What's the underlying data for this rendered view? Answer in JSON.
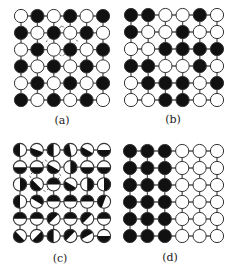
{
  "figure": {
    "panels": [
      {
        "id": "a",
        "label": "(a)",
        "description": "checkerboard spin arrangement",
        "type": "binary",
        "origin": [
          21,
          16
        ],
        "spacing": [
          16.4,
          16.8
        ],
        "label_pos": [
          62,
          120
        ],
        "grid": [
          "WBWBWB",
          "BWBWBW",
          "WBWBWB",
          "BWBWBW",
          "WBWBWB",
          "BWBWBW"
        ],
        "dashed_square": {
          "rows": [
            1,
            2
          ],
          "cols": [
            2,
            3
          ]
        }
      },
      {
        "id": "b",
        "label": "(b)",
        "description": "random binary arrangement",
        "type": "binary",
        "origin": [
          131,
          15
        ],
        "spacing": [
          17.2,
          17.0
        ],
        "label_pos": [
          173,
          119
        ],
        "grid": [
          "BBWWBW",
          "BWWBWW",
          "WWBBBB",
          "BBWWBW",
          "WBBBWB",
          "WWBBWW"
        ]
      },
      {
        "id": "c",
        "label": "(c)",
        "description": "half-filled circles with varied orientation (angle = direction black half points, degrees; 0=right, 90=down, 180=left, 270=up)",
        "type": "half",
        "origin": [
          20,
          150
        ],
        "spacing": [
          16.8,
          17.2
        ],
        "label_pos": [
          60,
          258
        ],
        "angles": [
          [
            180,
            110,
            180,
            170,
            120,
            90
          ],
          [
            90,
            90,
            120,
            0,
            90,
            90
          ],
          [
            0,
            135,
            270,
            120,
            0,
            0
          ],
          [
            180,
            300,
            270,
            270,
            270,
            200
          ],
          [
            270,
            270,
            225,
            270,
            225,
            270
          ],
          [
            135,
            45,
            180,
            225,
            240,
            90
          ]
        ],
        "dashed_square": {
          "rows": [
            1,
            2
          ],
          "cols": [
            1,
            2
          ]
        }
      },
      {
        "id": "d",
        "label": "(d)",
        "description": "phase-separated arrangement: left half black, right half white",
        "type": "binary",
        "origin": [
          130,
          151
        ],
        "spacing": [
          17.4,
          17.0
        ],
        "label_pos": [
          170,
          257
        ],
        "grid": [
          "BBBWWW",
          "BBBWWW",
          "BBBWWW",
          "BBBWWW",
          "BBBWWW",
          "BBBWWW"
        ]
      }
    ],
    "style": {
      "black": "#111111",
      "white": "#ffffff",
      "stroke": "#333333",
      "bond": "#555555",
      "radius": 6.6
    }
  }
}
